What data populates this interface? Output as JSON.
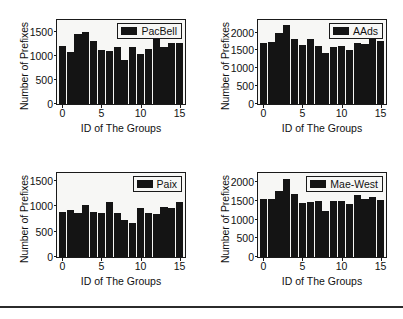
{
  "figure": {
    "background": "#ffffff",
    "bar_color": "#141414",
    "axis_color": "#1a1a1a",
    "plot_background": "#f7f7f5",
    "rule_color": "#2b2b2b"
  },
  "chart_data": [
    {
      "type": "bar",
      "title": "",
      "legend": "PacBell",
      "legend_position": "top-right",
      "xlabel": "ID of The Groups",
      "ylabel": "Number of Prefixes",
      "grid": false,
      "categories": [
        0,
        1,
        2,
        3,
        4,
        5,
        6,
        7,
        8,
        9,
        10,
        11,
        12,
        13,
        14,
        15
      ],
      "xticks": [
        0,
        5,
        10,
        15
      ],
      "xlim": [
        -0.7,
        15.7
      ],
      "yticks": [
        0,
        500,
        1000,
        1500
      ],
      "ylim": [
        0,
        1750
      ],
      "values": [
        1215,
        1075,
        1455,
        1495,
        1305,
        1120,
        1105,
        1185,
        920,
        1190,
        1040,
        1150,
        1350,
        1190,
        1275,
        1275
      ]
    },
    {
      "type": "bar",
      "title": "",
      "legend": "AAds",
      "legend_position": "top-right",
      "xlabel": "ID of The Groups",
      "ylabel": "Number of Prefixes",
      "grid": false,
      "categories": [
        0,
        1,
        2,
        3,
        4,
        5,
        6,
        7,
        8,
        9,
        10,
        11,
        12,
        13,
        14,
        15
      ],
      "xticks": [
        0,
        5,
        10,
        15
      ],
      "xlim": [
        -0.7,
        15.7
      ],
      "yticks": [
        0,
        500,
        1000,
        1500,
        2000
      ],
      "ylim": [
        0,
        2350
      ],
      "values": [
        1700,
        1735,
        1975,
        2220,
        1815,
        1645,
        1830,
        1620,
        1430,
        1600,
        1635,
        1525,
        1715,
        1675,
        1835,
        1750
      ]
    },
    {
      "type": "bar",
      "title": "",
      "legend": "Paix",
      "legend_position": "top-right",
      "xlabel": "ID of The Groups",
      "ylabel": "Number of Prefixes",
      "grid": false,
      "categories": [
        0,
        1,
        2,
        3,
        4,
        5,
        6,
        7,
        8,
        9,
        10,
        11,
        12,
        13,
        14,
        15
      ],
      "xticks": [
        0,
        5,
        10,
        15
      ],
      "xlim": [
        -0.7,
        15.7
      ],
      "yticks": [
        0,
        500,
        1000,
        1500
      ],
      "ylim": [
        0,
        1650
      ],
      "values": [
        885,
        915,
        855,
        1030,
        890,
        860,
        1085,
        860,
        730,
        660,
        955,
        870,
        840,
        975,
        970,
        1085
      ]
    },
    {
      "type": "bar",
      "title": "",
      "legend": "Mae-West",
      "legend_position": "top-right",
      "xlabel": "ID of The Groups",
      "ylabel": "Number of Prefixes",
      "grid": false,
      "categories": [
        0,
        1,
        2,
        3,
        4,
        5,
        6,
        7,
        8,
        9,
        10,
        11,
        12,
        13,
        14,
        15
      ],
      "xticks": [
        0,
        5,
        10,
        15
      ],
      "xlim": [
        -0.7,
        15.7
      ],
      "yticks": [
        0,
        500,
        1000,
        1500,
        2000
      ],
      "ylim": [
        0,
        2250
      ],
      "values": [
        1545,
        1545,
        1780,
        2095,
        1700,
        1450,
        1480,
        1490,
        1245,
        1490,
        1500,
        1425,
        1655,
        1545,
        1615,
        1535
      ]
    }
  ]
}
